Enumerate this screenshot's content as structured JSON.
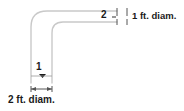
{
  "diagram": {
    "background_color": "#ffffff",
    "pipe_line_color": "#c8c8c8",
    "dimension_line_color": "#4d4d4d",
    "text_color": "#1a1a1a",
    "labels": {
      "station_1": "1",
      "station_2": "2",
      "diameter_top": "1 ft. diam.",
      "diameter_bottom": "2 ft. diam."
    },
    "annotations": {
      "top_dimension_name": "top-pipe-diameter-dimension",
      "bottom_dimension_name": "bottom-pipe-diameter-dimension",
      "top_section": "horizontal pipe run, 1 ft diameter, exits right",
      "bottom_section": "vertical pipe run, 2 ft diameter, exits bottom",
      "elbow": "90 degree rounded elbow joining vertical and horizontal runs"
    }
  }
}
